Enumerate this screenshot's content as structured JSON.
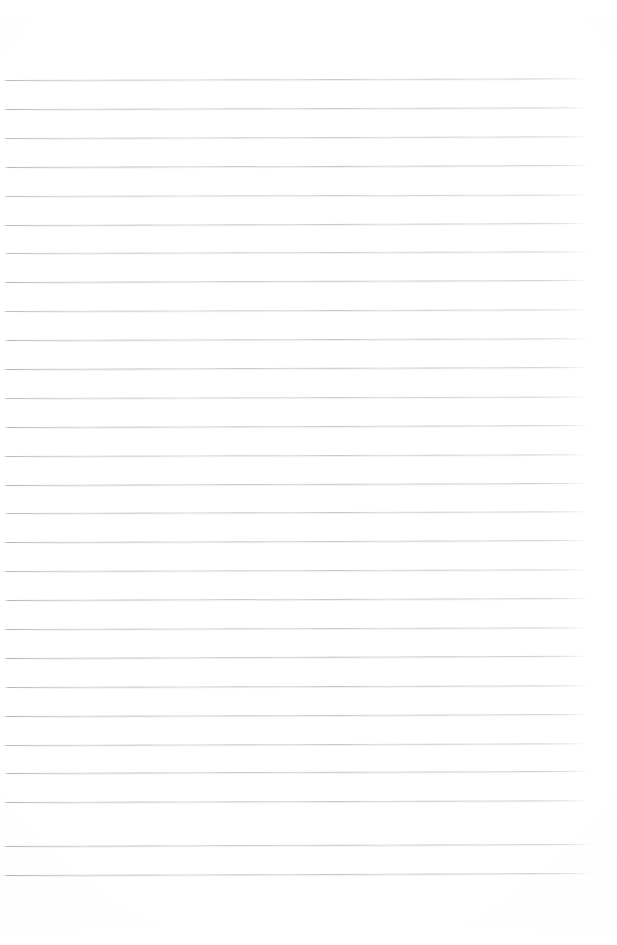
{
  "document": {
    "kind": "blank-ruled-notebook-paper",
    "title": "",
    "body_text": "",
    "page_width": 617,
    "page_height": 945,
    "background_color": "#ffffff",
    "rule_color": "#7c8088",
    "rule_count": 28,
    "rule_first_y": 80,
    "rule_spacing": 28.9,
    "rule_left_x": 3,
    "rule_right_x": 588,
    "rule_skew_deg": -0.18,
    "top_margin_px": 80,
    "bottom_margin_px": 70,
    "has_margin_rule": false,
    "has_header": false,
    "has_page_number": false,
    "notes": "Empty lined page; no text, no handwriting, no headings or page numbers are present."
  },
  "rules": [
    {
      "index": 1,
      "y": 80,
      "x1": 3,
      "x2": 588,
      "skew": -0.16,
      "opacity": 0.86
    },
    {
      "index": 2,
      "y": 109,
      "x1": 3,
      "x2": 589,
      "skew": -0.18,
      "opacity": 0.9
    },
    {
      "index": 3,
      "y": 138,
      "x1": 3,
      "x2": 589,
      "skew": -0.17,
      "opacity": 0.84
    },
    {
      "index": 4,
      "y": 167,
      "x1": 4,
      "x2": 590,
      "skew": -0.2,
      "opacity": 0.92
    },
    {
      "index": 5,
      "y": 196,
      "x1": 3,
      "x2": 589,
      "skew": -0.15,
      "opacity": 0.8
    },
    {
      "index": 6,
      "y": 225,
      "x1": 3,
      "x2": 588,
      "skew": -0.19,
      "opacity": 0.88
    },
    {
      "index": 7,
      "y": 253,
      "x1": 4,
      "x2": 590,
      "skew": -0.17,
      "opacity": 0.83
    },
    {
      "index": 8,
      "y": 282,
      "x1": 3,
      "x2": 589,
      "skew": -0.21,
      "opacity": 0.91
    },
    {
      "index": 9,
      "y": 311,
      "x1": 3,
      "x2": 588,
      "skew": -0.16,
      "opacity": 0.85
    },
    {
      "index": 10,
      "y": 340,
      "x1": 4,
      "x2": 590,
      "skew": -0.18,
      "opacity": 0.89
    },
    {
      "index": 11,
      "y": 369,
      "x1": 3,
      "x2": 589,
      "skew": -0.2,
      "opacity": 0.93
    },
    {
      "index": 12,
      "y": 398,
      "x1": 3,
      "x2": 588,
      "skew": -0.15,
      "opacity": 0.82
    },
    {
      "index": 13,
      "y": 427,
      "x1": 4,
      "x2": 590,
      "skew": -0.19,
      "opacity": 0.9
    },
    {
      "index": 14,
      "y": 456,
      "x1": 3,
      "x2": 589,
      "skew": -0.17,
      "opacity": 0.86
    },
    {
      "index": 15,
      "y": 485,
      "x1": 3,
      "x2": 588,
      "skew": -0.21,
      "opacity": 0.94
    },
    {
      "index": 16,
      "y": 513,
      "x1": 4,
      "x2": 590,
      "skew": -0.16,
      "opacity": 0.88
    },
    {
      "index": 17,
      "y": 542,
      "x1": 3,
      "x2": 589,
      "skew": -0.19,
      "opacity": 0.91
    },
    {
      "index": 18,
      "y": 571,
      "x1": 3,
      "x2": 588,
      "skew": -0.18,
      "opacity": 0.87
    },
    {
      "index": 19,
      "y": 600,
      "x1": 4,
      "x2": 590,
      "skew": -0.2,
      "opacity": 0.93
    },
    {
      "index": 20,
      "y": 629,
      "x1": 3,
      "x2": 589,
      "skew": -0.17,
      "opacity": 0.89
    },
    {
      "index": 21,
      "y": 658,
      "x1": 3,
      "x2": 588,
      "skew": -0.22,
      "opacity": 0.95
    },
    {
      "index": 22,
      "y": 687,
      "x1": 4,
      "x2": 590,
      "skew": -0.18,
      "opacity": 0.9
    },
    {
      "index": 23,
      "y": 716,
      "x1": 3,
      "x2": 589,
      "skew": -0.19,
      "opacity": 0.92
    },
    {
      "index": 24,
      "y": 745,
      "x1": 3,
      "x2": 588,
      "skew": -0.17,
      "opacity": 0.88
    },
    {
      "index": 25,
      "y": 773,
      "x1": 4,
      "x2": 590,
      "skew": -0.21,
      "opacity": 0.94
    },
    {
      "index": 26,
      "y": 802,
      "x1": 3,
      "x2": 589,
      "skew": -0.18,
      "opacity": 0.9
    },
    {
      "index": 27,
      "y": 846,
      "x1": 3,
      "x2": 592,
      "skew": -0.2,
      "opacity": 0.93
    },
    {
      "index": 28,
      "y": 875,
      "x1": 3,
      "x2": 592,
      "skew": -0.19,
      "opacity": 0.95
    }
  ]
}
